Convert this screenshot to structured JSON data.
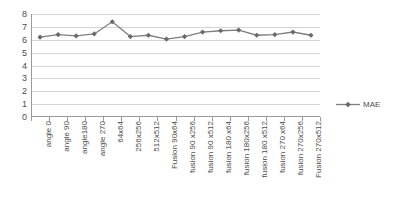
{
  "chart_data": {
    "type": "line",
    "title": "",
    "xlabel": "",
    "ylabel": "",
    "ylim": [
      0,
      8
    ],
    "ytick_labels": [
      "8",
      "7",
      "6",
      "5",
      "4",
      "3",
      "2",
      "1",
      "0"
    ],
    "ytick_values": [
      8,
      7,
      6,
      5,
      4,
      3,
      2,
      1,
      0
    ],
    "grid": true,
    "legend_position": "right",
    "marker": "diamond",
    "line_color": "#7f7f7f",
    "marker_color": "#696969",
    "gridline_color": "#d4d4d4",
    "axis_color": "#9a9a9a",
    "categories": [
      "angle 0",
      "angle 90",
      "angle180",
      "angle 270",
      "64x64",
      "256x256",
      "512x512",
      "Fusion 90x64",
      "fusion 90 x256",
      "fusion 90 x512",
      "fusion 180 x64",
      "fusion 180x256",
      "fusion 180 x512",
      "fusion 270 x64",
      "fusion 270x256",
      "Fusion 270x512"
    ],
    "series": [
      {
        "name": "MAE",
        "values": [
          6.2,
          6.4,
          6.3,
          6.45,
          7.4,
          6.25,
          6.35,
          6.05,
          6.25,
          6.6,
          6.7,
          6.75,
          6.35,
          6.4,
          6.6,
          6.35
        ]
      }
    ]
  },
  "legend": {
    "entries": [
      {
        "label": "MAE",
        "color": "#7f7f7f"
      }
    ]
  }
}
